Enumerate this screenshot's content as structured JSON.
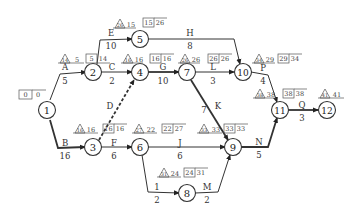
{
  "diagram": {
    "type": "activity-on-arrow network (CPM)",
    "nodes": [
      {
        "id": "1",
        "x": 47,
        "y": 110
      },
      {
        "id": "2",
        "x": 93,
        "y": 72
      },
      {
        "id": "3",
        "x": 93,
        "y": 147
      },
      {
        "id": "4",
        "x": 140,
        "y": 72
      },
      {
        "id": "5",
        "x": 140,
        "y": 39
      },
      {
        "id": "6",
        "x": 140,
        "y": 147
      },
      {
        "id": "7",
        "x": 187,
        "y": 72
      },
      {
        "id": "8",
        "x": 187,
        "y": 193
      },
      {
        "id": "9",
        "x": 233,
        "y": 147
      },
      {
        "id": "10",
        "x": 243,
        "y": 72
      },
      {
        "id": "11",
        "x": 280,
        "y": 110
      },
      {
        "id": "12",
        "x": 327,
        "y": 110
      }
    ],
    "activities": [
      {
        "name": "A",
        "duration": "5",
        "from": "1",
        "to": "2",
        "critical": false,
        "dashed": false
      },
      {
        "name": "B",
        "duration": "16",
        "from": "1",
        "to": "3",
        "critical": true,
        "dashed": false
      },
      {
        "name": "C",
        "duration": "2",
        "from": "2",
        "to": "4",
        "critical": false,
        "dashed": false
      },
      {
        "name": "D",
        "duration": "",
        "from": "3",
        "to": "4",
        "critical": true,
        "dashed": true
      },
      {
        "name": "E",
        "duration": "10",
        "from": "2",
        "to": "5",
        "critical": false,
        "dashed": false
      },
      {
        "name": "F",
        "duration": "6",
        "from": "3",
        "to": "6",
        "critical": false,
        "dashed": false
      },
      {
        "name": "G",
        "duration": "10",
        "from": "4",
        "to": "7",
        "critical": true,
        "dashed": false
      },
      {
        "name": "H",
        "duration": "8",
        "from": "5",
        "to": "10",
        "critical": false,
        "dashed": false
      },
      {
        "name": "I",
        "duration": "2",
        "from": "6",
        "to": "8",
        "critical": false,
        "dashed": false
      },
      {
        "name": "J",
        "duration": "6",
        "from": "6",
        "to": "9",
        "critical": false,
        "dashed": false
      },
      {
        "name": "K",
        "duration": "7",
        "from": "7",
        "to": "9",
        "critical": true,
        "dashed": false
      },
      {
        "name": "L",
        "duration": "3",
        "from": "7",
        "to": "10",
        "critical": false,
        "dashed": false
      },
      {
        "name": "M",
        "duration": "2",
        "from": "8",
        "to": "9",
        "critical": false,
        "dashed": false
      },
      {
        "name": "N",
        "duration": "5",
        "from": "9",
        "to": "11",
        "critical": true,
        "dashed": false
      },
      {
        "name": "P",
        "duration": "4",
        "from": "10",
        "to": "11",
        "critical": false,
        "dashed": false
      },
      {
        "name": "Q",
        "duration": "3",
        "from": "11",
        "to": "12",
        "critical": true,
        "dashed": false
      }
    ],
    "event_times": [
      {
        "node": "1",
        "box": [
          "0",
          "0"
        ]
      },
      {
        "node": "2",
        "triangle": "14",
        "tri_side": "5",
        "box": [
          "5",
          "14"
        ]
      },
      {
        "node": "5",
        "triangle": "26",
        "tri_side": "15",
        "box": [
          "15",
          "26"
        ]
      },
      {
        "node": "4",
        "triangle": "16",
        "tri_side": "16",
        "box": [
          "16",
          "16"
        ]
      },
      {
        "node": "7",
        "triangle": "26",
        "tri_side": "26",
        "box": [
          "26",
          "26"
        ]
      },
      {
        "node": "10",
        "triangle": "34",
        "tri_side": "29",
        "box": [
          "29",
          "34"
        ]
      },
      {
        "node": "11",
        "triangle": "38",
        "tri_side": "38",
        "box": [
          "38",
          "38"
        ]
      },
      {
        "node": "12",
        "triangle": "41",
        "tri_side": "41"
      },
      {
        "node": "3",
        "triangle": "16",
        "tri_side": "16",
        "box": [
          "16",
          "16"
        ]
      },
      {
        "node": "6",
        "triangle": "27",
        "tri_side": "22",
        "box": [
          "22",
          "27"
        ]
      },
      {
        "node": "9",
        "triangle": "33",
        "tri_side": "33",
        "box": [
          "33",
          "33"
        ]
      },
      {
        "node": "8",
        "triangle": "31",
        "tri_side": "24",
        "box": [
          "24",
          "31"
        ]
      }
    ]
  },
  "labels": {
    "n1": "1",
    "n2": "2",
    "n3": "3",
    "n4": "4",
    "n5": "5",
    "n6": "6",
    "n7": "7",
    "n8": "8",
    "n9": "9",
    "n10": "10",
    "n11": "11",
    "n12": "12",
    "A": "A",
    "A_d": "5",
    "B": "B",
    "B_d": "16",
    "C": "C",
    "C_d": "2",
    "D": "D",
    "E": "E",
    "E_d": "10",
    "F": "F",
    "F_d": "6",
    "G": "G",
    "G_d": "10",
    "H": "H",
    "H_d": "8",
    "I": "1",
    "I_d": "2",
    "J": "J",
    "J_d": "6",
    "K": "K",
    "K_d": "7",
    "L": "L",
    "L_d": "3",
    "M": "M",
    "M_d": "2",
    "N": "N",
    "N_d": "5",
    "P": "P",
    "P_d": "4",
    "Q": "Q",
    "Q_d": "3",
    "b1a": "0",
    "b1b": "0",
    "t2": "14",
    "s2": "5",
    "b2a": "5",
    "b2b": "14",
    "t5": "26",
    "s5": "15",
    "b5a": "15",
    "b5b": "26",
    "t4": "16",
    "s4": "16",
    "b4a": "16",
    "b4b": "16",
    "t7": "26",
    "s7": "26",
    "b7a": "26",
    "b7b": "26",
    "t10": "34",
    "s10": "29",
    "b10a": "29",
    "b10b": "34",
    "t11": "38",
    "s11": "38",
    "b11a": "38",
    "b11b": "38",
    "t12": "41",
    "s12": "41",
    "t3": "16",
    "s3": "16",
    "b3a": "16",
    "b3b": "16",
    "t6": "27",
    "s6": "22",
    "b6a": "22",
    "b6b": "27",
    "t9": "33",
    "s9": "33",
    "b9a": "33",
    "b9b": "33",
    "t8": "31",
    "s8": "24",
    "b8a": "24",
    "b8b": "31"
  }
}
